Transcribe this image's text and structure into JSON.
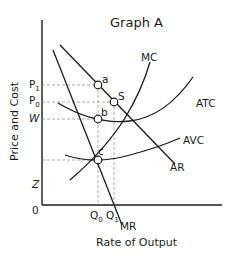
{
  "graph": {
    "title": "Graph A",
    "y_axis_label": "Price and Cost",
    "x_axis_label": "Rate of Output",
    "origin_label": "0",
    "y_ticks": {
      "p1": {
        "base": "P",
        "sub": "1"
      },
      "p0": {
        "base": "P",
        "sub": "0"
      },
      "w": "W",
      "z": "Z"
    },
    "x_ticks": {
      "q0": {
        "base": "Q",
        "sub": "0"
      },
      "q1": {
        "base": "Q",
        "sub": "1"
      }
    },
    "curves": {
      "mc": "MC",
      "atc": "ATC",
      "avc": "AVC",
      "ar": "AR",
      "mr": "MR"
    },
    "points": {
      "a": "a",
      "s": "S",
      "b": "b",
      "c": "c"
    }
  }
}
